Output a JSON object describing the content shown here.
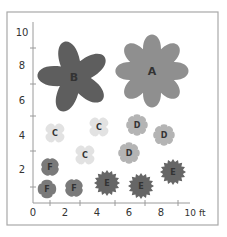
{
  "diagram": {
    "frame": {
      "x": 7,
      "y": 12,
      "w": 211,
      "h": 213,
      "stroke": "#a8a8a8"
    },
    "axes": {
      "origin": {
        "x": 33,
        "y": 203
      },
      "x_end": 190,
      "y_end": 22,
      "color": "#9a9a9a",
      "y_ticks": [
        48,
        84,
        116,
        151,
        187
      ],
      "x_ticks": [
        50,
        80,
        115,
        145,
        178
      ],
      "y_labels": [
        {
          "text": "10",
          "x": 22,
          "y": 36
        },
        {
          "text": "8",
          "x": 22,
          "y": 69
        },
        {
          "text": "6",
          "x": 22,
          "y": 104
        },
        {
          "text": "4",
          "x": 22,
          "y": 139
        },
        {
          "text": "2",
          "x": 22,
          "y": 173
        }
      ],
      "x_labels": [
        {
          "text": "0",
          "x": 33,
          "y": 216
        },
        {
          "text": "2",
          "x": 65,
          "y": 216
        },
        {
          "text": "4",
          "x": 97,
          "y": 216
        },
        {
          "text": "6",
          "x": 129,
          "y": 216
        },
        {
          "text": "8",
          "x": 161,
          "y": 216
        },
        {
          "text": "10 ft",
          "x": 195,
          "y": 216
        }
      ],
      "unit": "ft"
    },
    "colors": {
      "A": "#8f8f8f",
      "B": "#5e5e5e",
      "C": "#e2e2e2",
      "D": "#b4b4b4",
      "E": "#666666",
      "F": "#7a7a7a"
    },
    "shapes": [
      {
        "label": "B",
        "type": "star5",
        "cx": 74,
        "cy": 77,
        "r": 40,
        "rot": -15
      },
      {
        "label": "A",
        "type": "flower8",
        "cx": 152,
        "cy": 71,
        "r": 38,
        "rot": 0
      },
      {
        "label": "C",
        "type": "flower4",
        "cx": 55,
        "cy": 133,
        "r": 12,
        "rot": 0
      },
      {
        "label": "C",
        "type": "flower4",
        "cx": 99,
        "cy": 127,
        "r": 12,
        "rot": 0
      },
      {
        "label": "C",
        "type": "flower4",
        "cx": 85,
        "cy": 155,
        "r": 12,
        "rot": 0
      },
      {
        "label": "D",
        "type": "scallop",
        "cx": 137,
        "cy": 125,
        "r": 11,
        "rot": 0
      },
      {
        "label": "D",
        "type": "scallop",
        "cx": 164,
        "cy": 135,
        "r": 11,
        "rot": 0
      },
      {
        "label": "D",
        "type": "scallop",
        "cx": 129,
        "cy": 153,
        "r": 11,
        "rot": 0
      },
      {
        "label": "F",
        "type": "flower4sq",
        "cx": 50,
        "cy": 167,
        "r": 10,
        "rot": 45
      },
      {
        "label": "F",
        "type": "flower4sq",
        "cx": 47,
        "cy": 189,
        "r": 10,
        "rot": 0
      },
      {
        "label": "F",
        "type": "flower4sq",
        "cx": 74,
        "cy": 188,
        "r": 10,
        "rot": 45
      },
      {
        "label": "E",
        "type": "burst",
        "cx": 107,
        "cy": 183,
        "r": 13,
        "rot": 0
      },
      {
        "label": "E",
        "type": "burst",
        "cx": 141,
        "cy": 186,
        "r": 13,
        "rot": 0
      },
      {
        "label": "E",
        "type": "burst",
        "cx": 173,
        "cy": 172,
        "r": 13,
        "rot": 0
      }
    ]
  }
}
